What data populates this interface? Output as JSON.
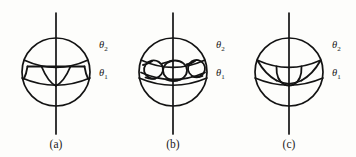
{
  "figure": {
    "background_color": "#fdfdfb",
    "stroke_color": "#131313",
    "panels": [
      {
        "id": "a",
        "caption": "(a)",
        "center_x": 56,
        "center_y": 72,
        "radius": 34,
        "axis_top_y": 13,
        "axis_bottom_y": 134,
        "labels": {
          "upper": {
            "theta": "θ",
            "subscript": "2"
          },
          "lower": {
            "theta": "θ",
            "subscript": "1"
          }
        },
        "label_upper_x": 99,
        "label_upper_y": 48,
        "label_lower_x": 99,
        "label_lower_y": 76,
        "interior_description": "single band with one downward cusp between two latitude circles"
      },
      {
        "id": "b",
        "caption": "(b)",
        "center_x": 173,
        "center_y": 72,
        "radius": 34,
        "axis_top_y": 13,
        "axis_bottom_y": 134,
        "labels": {
          "upper": {
            "theta": "θ",
            "subscript": "2"
          },
          "lower": {
            "theta": "θ",
            "subscript": "1"
          }
        },
        "label_upper_x": 216,
        "label_upper_y": 48,
        "label_lower_x": 216,
        "label_lower_y": 76,
        "interior_description": "three overlapping oval loops inside the band between two latitude circles"
      },
      {
        "id": "c",
        "caption": "(c)",
        "center_x": 289,
        "center_y": 72,
        "radius": 34,
        "axis_top_y": 13,
        "axis_bottom_y": 134,
        "labels": {
          "upper": {
            "theta": "θ",
            "subscript": "2"
          },
          "lower": {
            "theta": "θ",
            "subscript": "1"
          }
        },
        "label_upper_x": 332,
        "label_upper_y": 48,
        "label_lower_x": 332,
        "label_lower_y": 76,
        "interior_description": "scalloped arcs hanging from upper latitude with central U-shaped loop"
      }
    ],
    "caption_y": 148,
    "caption_a_x": 56,
    "caption_b_x": 173,
    "caption_c_x": 289
  }
}
